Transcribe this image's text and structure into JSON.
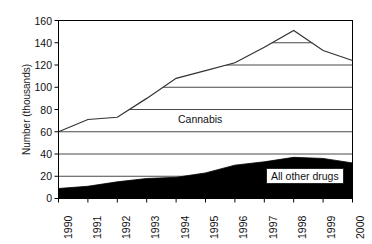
{
  "chart_data": {
    "type": "area",
    "title": "",
    "xlabel": "",
    "ylabel": "Number (thousands)",
    "ylim": [
      0,
      160
    ],
    "yticks": [
      0,
      20,
      40,
      60,
      80,
      100,
      120,
      140,
      160
    ],
    "categories": [
      "1990",
      "1991",
      "1992",
      "1993",
      "1994",
      "1995",
      "1996",
      "1997",
      "1998",
      "1999",
      "2000"
    ],
    "grid": "horizontal-gridlines-clipped-to-white-region",
    "legend": "inline-labels",
    "stacked": true,
    "series": [
      {
        "name": "All other drugs",
        "fill": "#000000",
        "values": [
          9,
          11,
          15,
          18,
          19,
          23,
          30,
          33,
          37,
          36,
          32
        ]
      },
      {
        "name": "Cannabis",
        "fill": "#ffffff",
        "cumulative_top_values": [
          60,
          71,
          73,
          90,
          108,
          115,
          122,
          136,
          151,
          133,
          124
        ],
        "values": [
          51,
          60,
          58,
          72,
          89,
          92,
          92,
          103,
          114,
          97,
          92
        ]
      }
    ],
    "annotations": [
      {
        "text": "Cannabis",
        "x": "1994-1995",
        "y": 118
      },
      {
        "text": "All other drugs",
        "x": "1997-2000",
        "y": 24
      }
    ]
  },
  "axis": {
    "y_tick_labels": [
      "160",
      "140",
      "120",
      "100",
      "80",
      "60",
      "40",
      "20",
      "0"
    ],
    "y_title": "Number (thousands)",
    "x_tick_labels": [
      "1990",
      "1991",
      "1992",
      "1993",
      "1994",
      "1995",
      "1996",
      "1997",
      "1998",
      "1999",
      "2000"
    ]
  },
  "labels": {
    "cannabis": "Cannabis",
    "all_other_drugs": "All other drugs"
  },
  "colors": {
    "background": "#ffffff",
    "axis": "#000000",
    "gridline": "#4a4a4a",
    "line": "#333333",
    "area_fill": "#000000",
    "text": "#111111"
  }
}
